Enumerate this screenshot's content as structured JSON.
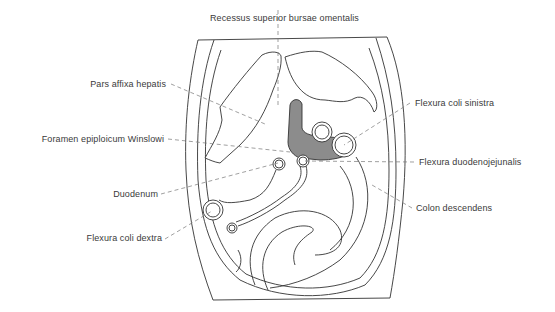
{
  "figure": {
    "type": "anatomical-diagram",
    "colors": {
      "line": "#333333",
      "leader": "#777777",
      "bursa_fill": "#8c8c8c",
      "background": "#ffffff",
      "label_text": "#3a3a3a"
    },
    "labels": {
      "top": [
        {
          "id": "recessus",
          "text": "Recessus superior bursae omentalis"
        }
      ],
      "left": [
        {
          "id": "pars_affixa",
          "text": "Pars affixa hepatis"
        },
        {
          "id": "foramen",
          "text": "Foramen epiploicum Winslowi"
        },
        {
          "id": "duodenum",
          "text": "Duodenum"
        },
        {
          "id": "flexura_dextra",
          "text": "Flexura coli dextra"
        }
      ],
      "right": [
        {
          "id": "flexura_sinistra",
          "text": "Flexura coli sinistra"
        },
        {
          "id": "flexura_duodenojejunalis",
          "text": "Flexura duodenojejunalis"
        },
        {
          "id": "colon_descendens",
          "text": "Colon descendens"
        }
      ]
    }
  }
}
